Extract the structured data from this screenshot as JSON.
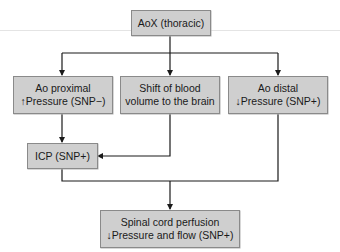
{
  "diagram": {
    "nodes": {
      "aox": {
        "lines": [
          "AoX (thoracic)"
        ]
      },
      "ao_proximal": {
        "lines": [
          "Ao proximal",
          "↑Pressure (SNP−)"
        ]
      },
      "shift_blood": {
        "lines": [
          "Shift of blood",
          "volume to the brain"
        ]
      },
      "ao_distal": {
        "lines": [
          "Ao distal",
          "↓Pressure (SNP+)"
        ]
      },
      "icp": {
        "lines": [
          "ICP (SNP+)"
        ]
      },
      "spinal": {
        "lines": [
          "Spinal cord perfusion",
          "↓Pressure and flow (SNP+)"
        ]
      }
    },
    "edges": [
      [
        "aox",
        "ao_proximal"
      ],
      [
        "aox",
        "shift_blood"
      ],
      [
        "aox",
        "ao_distal"
      ],
      [
        "ao_proximal",
        "icp"
      ],
      [
        "shift_blood",
        "icp"
      ],
      [
        "icp",
        "spinal"
      ],
      [
        "ao_distal",
        "spinal"
      ]
    ],
    "colors": {
      "box_fill": "#cfcfcf",
      "box_border": "#8a8a8a",
      "line": "#1a1a1a"
    }
  }
}
